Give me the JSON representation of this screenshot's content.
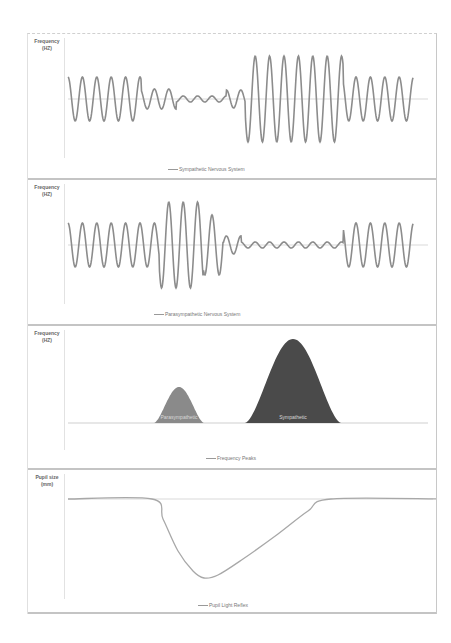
{
  "colors": {
    "wave": "#8c8c8c",
    "baseline": "#cfcfcf",
    "peak_small": "#8a8a8a",
    "peak_large": "#4a4a4a",
    "peak_label": "#d8d8d8",
    "pupil": "#a8a8a8"
  },
  "panels": [
    {
      "ylabel_line1": "Frequency",
      "ylabel_line2": "(HZ)",
      "legend": "Sympathetic Nervous System"
    },
    {
      "ylabel_line1": "Frequency",
      "ylabel_line2": "(HZ)",
      "legend": "Parasympathetic Nervous System"
    },
    {
      "ylabel_line1": "Frequency",
      "ylabel_line2": "(HZ)",
      "legend": "Frequency Peaks"
    },
    {
      "ylabel_line1": "Pupil size",
      "ylabel_line2": "(mm)",
      "legend": "Pupil Light Reflex"
    }
  ],
  "chart_data": [
    {
      "type": "line",
      "title": "",
      "ylabel": "Frequency (HZ)",
      "xlabel": "",
      "legend": [
        "Sympathetic Nervous System"
      ],
      "grid": false,
      "baseline": 0,
      "period_px": 14.4,
      "segments": [
        {
          "x_start": 0,
          "x_end": 73,
          "amplitude": 22
        },
        {
          "x_start": 73,
          "x_end": 108,
          "amplitude": 10
        },
        {
          "x_start": 108,
          "x_end": 158,
          "amplitude": 3
        },
        {
          "x_start": 158,
          "x_end": 177,
          "amplitude": 9
        },
        {
          "x_start": 177,
          "x_end": 275,
          "amplitude": 43
        },
        {
          "x_start": 275,
          "x_end": 345,
          "amplitude": 22
        }
      ]
    },
    {
      "type": "line",
      "title": "",
      "ylabel": "Frequency (HZ)",
      "xlabel": "",
      "legend": [
        "Parasympathetic Nervous System"
      ],
      "grid": false,
      "baseline": 0,
      "period_px": 14.4,
      "segments": [
        {
          "x_start": 0,
          "x_end": 91,
          "amplitude": 22
        },
        {
          "x_start": 91,
          "x_end": 135,
          "amplitude": 43
        },
        {
          "x_start": 135,
          "x_end": 155,
          "amplitude": 30
        },
        {
          "x_start": 155,
          "x_end": 173,
          "amplitude": 9
        },
        {
          "x_start": 173,
          "x_end": 275,
          "amplitude": 3
        },
        {
          "x_start": 275,
          "x_end": 345,
          "amplitude": 22
        }
      ]
    },
    {
      "type": "area",
      "title": "",
      "ylabel": "Frequency (HZ)",
      "xlabel": "",
      "legend": [
        "Frequency Peaks"
      ],
      "grid": false,
      "peaks": [
        {
          "label": "Parasympathetic",
          "x_start": 86,
          "x_end": 136,
          "height": 36,
          "shade": "small"
        },
        {
          "label": "Sympathetic",
          "x_start": 177,
          "x_end": 273,
          "height": 84,
          "shade": "large"
        }
      ]
    },
    {
      "type": "line",
      "title": "",
      "ylabel": "Pupil size (mm)",
      "xlabel": "",
      "legend": [
        "Pupil Light Reflex"
      ],
      "grid": false,
      "baseline": 0,
      "points": [
        [
          0,
          0
        ],
        [
          84,
          0
        ],
        [
          95,
          -20
        ],
        [
          110,
          -52
        ],
        [
          125,
          -72
        ],
        [
          136,
          -79
        ],
        [
          150,
          -76
        ],
        [
          175,
          -60
        ],
        [
          210,
          -35
        ],
        [
          240,
          -12
        ],
        [
          263,
          0
        ],
        [
          373,
          0
        ]
      ]
    }
  ]
}
